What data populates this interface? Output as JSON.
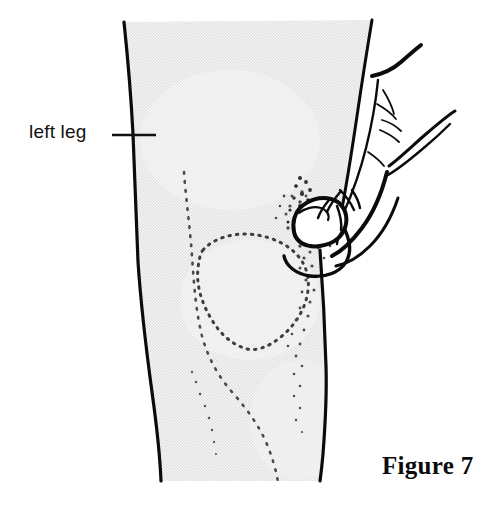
{
  "figure": {
    "domain": "anatomical-illustration",
    "caption": "Figure 7",
    "annotations": [
      {
        "id": "left-leg",
        "text": "left leg",
        "leader_line": {
          "x1": 112,
          "y1": 135,
          "x2": 156,
          "y2": 135
        },
        "text_position": {
          "x": 29,
          "y": 122
        }
      }
    ],
    "colors": {
      "ink": "#111111",
      "outline": "#0b0b0b",
      "skin_fill": "#ebebeb",
      "stipple_dot": "#555555",
      "background": "#ffffff"
    },
    "subject": {
      "name": "left leg with knee and examining hand",
      "parts": [
        {
          "name": "leg-silhouette",
          "description": "shaded leg shaft cropped top and bottom"
        },
        {
          "name": "patella-stipple-outline",
          "description": "dotted kneecap contour"
        },
        {
          "name": "lateral-dotted-contour",
          "description": "dotted muscle contour on outer leg"
        },
        {
          "name": "examining-hand",
          "description": "hand in profile with thumb pressing knee"
        },
        {
          "name": "thumb",
          "description": "thumb tip pressing into the knee joint"
        },
        {
          "name": "index-finger",
          "description": "index finger extended upward to the right"
        },
        {
          "name": "second-finger",
          "description": "finger extended to the right"
        }
      ]
    },
    "geometry": {
      "leg_outline_left": "M124,22 C128,60 131,96 133,134 C135,176 136,220 138,262 C141,306 146,348 152,392 C157,428 160,456 161,481",
      "leg_outline_right_upper": "M372,20 C367,50 362,82 357,116 C352,150 347,182 341,214",
      "leg_outline_right_lower": "M320,250 C323,290 325,330 326,366 C327,398 325,428 323,454 C322,468 321,476 320,481",
      "leg_bottom_y": 481,
      "patella": {
        "cx": 248,
        "cy": 288,
        "rx": 56,
        "ry": 52
      }
    }
  }
}
